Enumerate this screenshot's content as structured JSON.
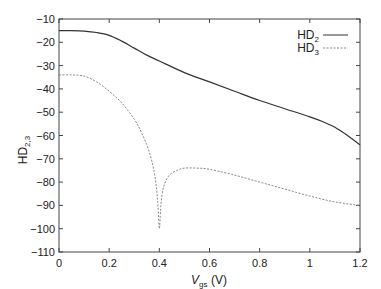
{
  "chart_data": {
    "type": "line",
    "title": "",
    "xlabel": "V_gs (V)",
    "xlabel_main": "V",
    "xlabel_sub": "gs",
    "xlabel_unit": " (V)",
    "ylabel": "HD_2,3",
    "ylabel_main": "HD",
    "ylabel_sub": "2,3",
    "xlim": [
      0,
      1.2
    ],
    "ylim": [
      -110,
      -10
    ],
    "xticks": [
      "0",
      "0.2",
      "0.4",
      "0.6",
      "0.8",
      "1",
      "1.2"
    ],
    "yticks": [
      "-10",
      "-20",
      "-30",
      "-40",
      "-50",
      "-60",
      "-70",
      "-80",
      "-90",
      "-100",
      "-110"
    ],
    "grid": false,
    "legend_position": "top-right",
    "series": [
      {
        "name": "HD2",
        "label_main": "HD",
        "label_sub": "2",
        "style": "solid",
        "color": "#333333",
        "x": [
          0,
          0.05,
          0.1,
          0.15,
          0.2,
          0.25,
          0.3,
          0.35,
          0.4,
          0.5,
          0.6,
          0.7,
          0.8,
          0.9,
          1.0,
          1.05,
          1.1,
          1.15,
          1.2
        ],
        "y": [
          -15,
          -15,
          -15.2,
          -15.8,
          -17,
          -19.5,
          -22.5,
          -25.5,
          -28,
          -33,
          -37,
          -41,
          -45,
          -48.5,
          -52,
          -54,
          -56.5,
          -60,
          -64
        ]
      },
      {
        "name": "HD3",
        "label_main": "HD",
        "label_sub": "3",
        "style": "dashed",
        "color": "#888888",
        "x": [
          0,
          0.05,
          0.1,
          0.15,
          0.2,
          0.25,
          0.3,
          0.33,
          0.36,
          0.38,
          0.39,
          0.395,
          0.4,
          0.405,
          0.41,
          0.42,
          0.44,
          0.47,
          0.5,
          0.55,
          0.6,
          0.7,
          0.8,
          0.9,
          1.0,
          1.1,
          1.2
        ],
        "y": [
          -34,
          -34,
          -34.5,
          -37,
          -41,
          -46,
          -53,
          -59,
          -67,
          -76,
          -84,
          -91,
          -100,
          -92,
          -86,
          -81,
          -77,
          -75,
          -74,
          -74,
          -74.5,
          -77,
          -80,
          -83,
          -86,
          -88.5,
          -90
        ]
      }
    ]
  }
}
